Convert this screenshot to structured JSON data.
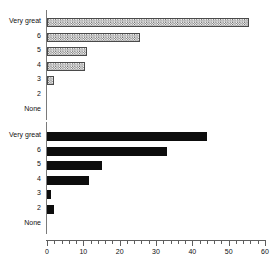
{
  "chart_data": [
    {
      "type": "bar",
      "orientation": "horizontal",
      "panel": "top",
      "title": "",
      "xlabel": "",
      "ylabel": "",
      "xlim": [
        0,
        60
      ],
      "grid": false,
      "legend": null,
      "bar_style": "hatched",
      "categories": [
        "Very great",
        "6",
        "5",
        "4",
        "3",
        "2",
        "None"
      ],
      "values": [
        55.5,
        25.5,
        11,
        10.5,
        2,
        0,
        0
      ],
      "xticks": [
        0,
        10,
        20,
        30,
        40,
        50,
        60
      ],
      "xticklabels": [
        "0",
        "10",
        "20",
        "30",
        "40",
        "50",
        "60"
      ],
      "minor_tick_step": 2
    },
    {
      "type": "bar",
      "orientation": "horizontal",
      "panel": "bottom",
      "title": "",
      "xlabel": "",
      "ylabel": "",
      "xlim": [
        0,
        60
      ],
      "grid": false,
      "legend": null,
      "bar_style": "solid",
      "categories": [
        "Very great",
        "6",
        "5",
        "4",
        "3",
        "2",
        "None"
      ],
      "values": [
        44,
        33,
        15,
        11.5,
        1,
        2,
        0
      ],
      "xticks": [
        0,
        10,
        20,
        30,
        40,
        50,
        60
      ],
      "xticklabels": [
        "0",
        "10",
        "20",
        "30",
        "40",
        "50",
        "60"
      ],
      "minor_tick_step": 2
    }
  ],
  "axis": {
    "x_min": 0,
    "x_max": 60,
    "ticks": [
      "0",
      "10",
      "20",
      "30",
      "40",
      "50",
      "60"
    ]
  },
  "colors": {
    "bar_solid": "#0d0d0d",
    "bar_hatched_fill": "#b9b9b9",
    "bar_hatched_edge": "#4a4a4a",
    "axis": "#5e5e5e",
    "text": "#111111",
    "background": "#ffffff"
  }
}
